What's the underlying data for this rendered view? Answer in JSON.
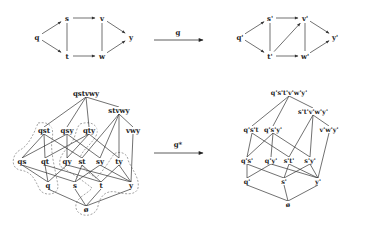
{
  "figure": {
    "top_left_graph": {
      "name": "G",
      "nodes": [
        {
          "id": "q",
          "label": "q",
          "x": 37,
          "y": 37
        },
        {
          "id": "s",
          "label": "s",
          "x": 67,
          "y": 18
        },
        {
          "id": "t",
          "label": "t",
          "x": 67,
          "y": 56
        },
        {
          "id": "v",
          "label": "v",
          "x": 102,
          "y": 18
        },
        {
          "id": "w",
          "label": "w",
          "x": 102,
          "y": 56
        },
        {
          "id": "y",
          "label": "y",
          "x": 131,
          "y": 37
        }
      ],
      "directed_edges": [
        [
          "q",
          "s"
        ],
        [
          "q",
          "t"
        ],
        [
          "s",
          "v"
        ],
        [
          "t",
          "w"
        ],
        [
          "v",
          "y"
        ],
        [
          "w",
          "y"
        ]
      ],
      "undirected_edges": [
        [
          "s",
          "t"
        ],
        [
          "v",
          "w"
        ]
      ]
    },
    "top_arrow": {
      "label": "g"
    },
    "top_right_graph": {
      "name": "G'",
      "nodes": [
        {
          "id": "q",
          "label": "q'",
          "x": 240,
          "y": 37
        },
        {
          "id": "s",
          "label": "s'",
          "x": 270,
          "y": 18
        },
        {
          "id": "t",
          "label": "t'",
          "x": 270,
          "y": 56
        },
        {
          "id": "v",
          "label": "v'",
          "x": 305,
          "y": 18
        },
        {
          "id": "w",
          "label": "w'",
          "x": 305,
          "y": 56
        },
        {
          "id": "y",
          "label": "y'",
          "x": 335,
          "y": 37
        }
      ],
      "directed_edges": [
        [
          "q",
          "s"
        ],
        [
          "q",
          "t"
        ],
        [
          "s",
          "v"
        ],
        [
          "t",
          "w"
        ],
        [
          "t",
          "v"
        ],
        [
          "v",
          "y"
        ],
        [
          "w",
          "y"
        ]
      ],
      "undirected_edges": [
        [
          "s",
          "t"
        ],
        [
          "v",
          "w"
        ]
      ]
    },
    "bottom_arrow": {
      "label": "g*"
    },
    "left_lattice": {
      "nodes": [
        {
          "id": "qstvwy",
          "label": "qstvwy",
          "x": 86,
          "y": 94
        },
        {
          "id": "stvwy",
          "label": "stvwy",
          "x": 119,
          "y": 111
        },
        {
          "id": "qst",
          "label": "qst",
          "x": 44,
          "y": 131
        },
        {
          "id": "qsy",
          "label": "qsy",
          "x": 67,
          "y": 131
        },
        {
          "id": "qty",
          "label": "qty",
          "x": 89,
          "y": 131
        },
        {
          "id": "vwy",
          "label": "vwy",
          "x": 133,
          "y": 131
        },
        {
          "id": "qs",
          "label": "qs",
          "x": 22,
          "y": 162
        },
        {
          "id": "qt",
          "label": "qt",
          "x": 45,
          "y": 162
        },
        {
          "id": "qv",
          "label": "qy",
          "x": 67,
          "y": 162
        },
        {
          "id": "st",
          "label": "st",
          "x": 82,
          "y": 162
        },
        {
          "id": "sy",
          "label": "sy",
          "x": 100,
          "y": 162
        },
        {
          "id": "ty",
          "label": "ty",
          "x": 119,
          "y": 162
        },
        {
          "id": "q",
          "label": "q",
          "x": 48,
          "y": 186
        },
        {
          "id": "s",
          "label": "s",
          "x": 75,
          "y": 186
        },
        {
          "id": "t",
          "label": "t",
          "x": 101,
          "y": 186
        },
        {
          "id": "y",
          "label": "y",
          "x": 131,
          "y": 186
        },
        {
          "id": "empty",
          "label": "ø",
          "x": 86,
          "y": 210
        }
      ],
      "edges": [
        [
          "qstvwy",
          "stvwy"
        ],
        [
          "qstvwy",
          "qst"
        ],
        [
          "qstvwy",
          "qsy"
        ],
        [
          "qstvwy",
          "qty"
        ],
        [
          "stvwy",
          "st"
        ],
        [
          "stvwy",
          "sy"
        ],
        [
          "stvwy",
          "ty"
        ],
        [
          "stvwy",
          "vwy"
        ],
        [
          "qst",
          "qs"
        ],
        [
          "qst",
          "qt"
        ],
        [
          "qst",
          "st"
        ],
        [
          "qsy",
          "qs"
        ],
        [
          "qsy",
          "qv"
        ],
        [
          "qsy",
          "sy"
        ],
        [
          "qty",
          "qt"
        ],
        [
          "qty",
          "qv"
        ],
        [
          "qty",
          "ty"
        ],
        [
          "vwy",
          "y"
        ],
        [
          "qs",
          "q"
        ],
        [
          "qs",
          "s"
        ],
        [
          "qt",
          "q"
        ],
        [
          "qt",
          "t"
        ],
        [
          "qv",
          "q"
        ],
        [
          "qv",
          "y"
        ],
        [
          "st",
          "s"
        ],
        [
          "st",
          "t"
        ],
        [
          "sy",
          "s"
        ],
        [
          "sy",
          "y"
        ],
        [
          "ty",
          "t"
        ],
        [
          "ty",
          "y"
        ],
        [
          "q",
          "empty"
        ],
        [
          "s",
          "empty"
        ],
        [
          "t",
          "empty"
        ],
        [
          "y",
          "empty"
        ]
      ],
      "dashed_groups": [
        {
          "members": [
            "qst",
            "qs",
            "qt",
            "q"
          ]
        },
        {
          "members": [
            "qty",
            "qv",
            "ty",
            "t",
            "y",
            "empty"
          ]
        }
      ]
    },
    "right_lattice": {
      "nodes": [
        {
          "id": "top",
          "label": "q's't'v'w'y'",
          "x": 289,
          "y": 93
        },
        {
          "id": "stvwy",
          "label": "s't'v'w'y'",
          "x": 313,
          "y": 112
        },
        {
          "id": "qst",
          "label": "q's't'",
          "x": 252,
          "y": 130
        },
        {
          "id": "qsy",
          "label": "q's'y'",
          "x": 273,
          "y": 130
        },
        {
          "id": "vwy",
          "label": "v'w'y'",
          "x": 329,
          "y": 130
        },
        {
          "id": "qs",
          "label": "q's'",
          "x": 247,
          "y": 161
        },
        {
          "id": "qy",
          "label": "q'y'",
          "x": 271,
          "y": 161
        },
        {
          "id": "st",
          "label": "s't'",
          "x": 289,
          "y": 161
        },
        {
          "id": "sy",
          "label": "s'y'",
          "x": 310,
          "y": 161
        },
        {
          "id": "q",
          "label": "q'",
          "x": 247,
          "y": 182
        },
        {
          "id": "s",
          "label": "s'",
          "x": 284,
          "y": 182
        },
        {
          "id": "y",
          "label": "y'",
          "x": 318,
          "y": 182
        },
        {
          "id": "empty",
          "label": "ø",
          "x": 288,
          "y": 205
        }
      ],
      "edges": [
        [
          "top",
          "stvwy"
        ],
        [
          "top",
          "qst"
        ],
        [
          "top",
          "qsy"
        ],
        [
          "stvwy",
          "st"
        ],
        [
          "stvwy",
          "sy"
        ],
        [
          "stvwy",
          "vwy"
        ],
        [
          "qst",
          "qs"
        ],
        [
          "qst",
          "st"
        ],
        [
          "qsy",
          "qs"
        ],
        [
          "qsy",
          "qy"
        ],
        [
          "qsy",
          "sy"
        ],
        [
          "vwy",
          "y"
        ],
        [
          "qs",
          "q"
        ],
        [
          "qs",
          "s"
        ],
        [
          "qy",
          "q"
        ],
        [
          "qy",
          "y"
        ],
        [
          "st",
          "s"
        ],
        [
          "st",
          "y"
        ],
        [
          "sy",
          "s"
        ],
        [
          "sy",
          "y"
        ],
        [
          "q",
          "empty"
        ],
        [
          "s",
          "empty"
        ],
        [
          "y",
          "empty"
        ]
      ]
    }
  }
}
